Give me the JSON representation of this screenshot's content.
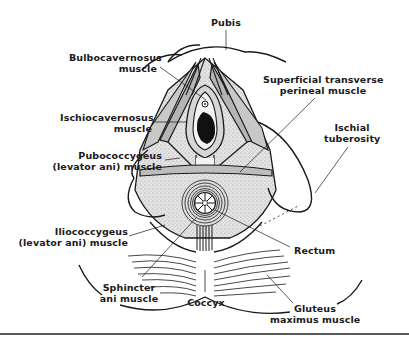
{
  "diagram": {
    "labels": {
      "pubis": "Pubis",
      "bulbocavernosus": [
        "Bulbocavernosus",
        "muscle"
      ],
      "ischiocavernosus": [
        "Ischiocavernosus",
        "muscle"
      ],
      "pubococcygeus": [
        "Pubococcygeus",
        "(levator ani) muscle"
      ],
      "superficial_transverse": [
        "Superficial transverse",
        "perineal muscle"
      ],
      "ischial_tuberosity": [
        "Ischial",
        "tuberosity"
      ],
      "iliococcygeus": [
        "Iliococcygeus",
        "(levator ani) muscle"
      ],
      "rectum": "Rectum",
      "sphincter_ani": [
        "Sphincter",
        "ani muscle"
      ],
      "coccyx": "Coccyx",
      "gluteus_maximus": [
        "Gluteus",
        "maximus muscle"
      ]
    },
    "colors": {
      "ink": "#1a1a1a",
      "muscle_shade": "#b5b5b5",
      "tissue_light": "#dcdcdc",
      "background": "#ffffff",
      "orifice": "#111111"
    }
  }
}
